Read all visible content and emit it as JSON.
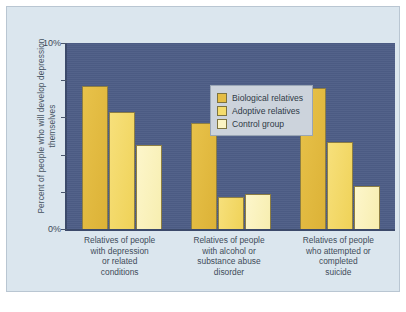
{
  "chart_data": {
    "type": "bar",
    "title": "",
    "xlabel": "",
    "ylabel": "Percent of people who will develop depression themselves",
    "ylim": [
      0,
      10
    ],
    "ytick_labels": [
      "10%",
      "0%"
    ],
    "grid": false,
    "legend_position": "top-center",
    "categories": [
      "Relatives of people with depression or related conditions",
      "Relatives of people with alcohol or substance abuse disorder",
      "Relatives of people who attempted or completed suicide"
    ],
    "category_lines": [
      [
        "Relatives of people",
        "with depression",
        "or related",
        "conditions"
      ],
      [
        "Relatives of people",
        "with alcohol or",
        "substance abuse",
        "disorder"
      ],
      [
        "Relatives of people",
        "who attempted or",
        "completed",
        "suicide"
      ]
    ],
    "series": [
      {
        "name": "Biological relatives",
        "color": "#e5bd44",
        "values": [
          7.7,
          5.7,
          7.6
        ]
      },
      {
        "name": "Adoptive relatives",
        "color": "#f4dc6c",
        "values": [
          6.3,
          1.7,
          4.7
        ]
      },
      {
        "name": "Control group",
        "color": "#fbf4c4",
        "values": [
          4.5,
          1.9,
          2.3
        ]
      }
    ]
  },
  "colors": {
    "page_background": "#dbe6ee",
    "plot_background": "#4d5d86",
    "axis": "#3c4a6b",
    "legend_background": "#ccd3dc",
    "text": "#3f4c5a"
  }
}
